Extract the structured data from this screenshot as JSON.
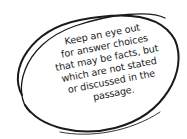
{
  "callout": {
    "shape": "hand-drawn-oval",
    "stroke_color": "#1a1a1a",
    "lines": [
      "Keep an eye out",
      "for answer choices",
      "that may be facts, but",
      "which are not stated",
      "or discussed in the",
      "passage."
    ]
  }
}
